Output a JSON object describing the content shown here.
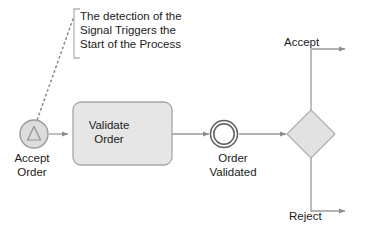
{
  "diagram": {
    "type": "bpmn-process-diagram",
    "background": "#ffffff",
    "colors": {
      "shape_fill": "#e2e2e2",
      "task_fill": "#e6e6e6",
      "event_fill": "#ffffff",
      "stroke": "#9a9a9a",
      "text": "#1b1b1b",
      "connector": "#9a9a9a"
    },
    "annotation": {
      "text": "The detection of the\nSignal Triggers the\nStart of the Process",
      "bracket": "left-bracket"
    },
    "nodes": [
      {
        "id": "start-event",
        "kind": "signal-start-event",
        "label": "Accept\nOrder",
        "shape": "circle-with-triangle"
      },
      {
        "id": "task",
        "kind": "task",
        "label": "Validate\nOrder",
        "shape": "rounded-rectangle"
      },
      {
        "id": "intermediate-event",
        "kind": "intermediate-event",
        "label": "Order\nValidated",
        "shape": "double-circle"
      },
      {
        "id": "gateway",
        "kind": "exclusive-gateway",
        "label": "",
        "shape": "diamond"
      }
    ],
    "flows": [
      {
        "id": "flow-accept",
        "label": "Accept",
        "from": "gateway",
        "direction": "up-right"
      },
      {
        "id": "flow-reject",
        "label": "Reject",
        "from": "gateway",
        "direction": "down-right"
      }
    ]
  }
}
